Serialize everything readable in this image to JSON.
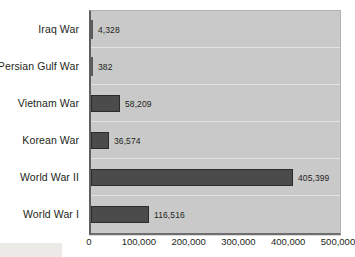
{
  "chart_data": {
    "type": "bar",
    "orientation": "horizontal",
    "title": "",
    "xlabel": "",
    "ylabel": "",
    "categories": [
      "Iraq War",
      "Persian Gulf War",
      "Vietnam War",
      "Korean War",
      "World War II",
      "World War I"
    ],
    "values": [
      4328,
      382,
      58209,
      36574,
      405399,
      116516
    ],
    "value_labels": [
      "4,328",
      "382",
      "58,209",
      "36,574",
      "405,399",
      "116,516"
    ],
    "xlim": [
      0,
      500000
    ],
    "xticks": [
      0,
      100000,
      200000,
      300000,
      400000,
      500000
    ],
    "xtick_labels": [
      "0",
      "100,000",
      "200,000",
      "300,000",
      "400,000",
      "500,000"
    ],
    "grid": true,
    "legend": "none",
    "series": [
      {
        "name": "Casualties",
        "values": [
          4328,
          382,
          58209,
          36574,
          405399,
          116516
        ]
      }
    ],
    "colors": {
      "bar_fill": "#4b4b4b",
      "bar_border": "#2b2b2b",
      "plot_background": "#c9c9c9",
      "page_background": "#ffffff",
      "gridline": "#e3e3e3",
      "text": "#231f20",
      "axis_line": "#5f5f5f"
    }
  }
}
